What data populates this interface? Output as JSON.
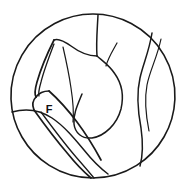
{
  "figure": {
    "kind": "endoscopic-line-drawing",
    "field_shape": "circle",
    "background_color": "#ffffff",
    "line_color": "#1a1a1a",
    "field": {
      "center_x": 93,
      "center_y": 96,
      "radius": 82
    },
    "labels": [
      {
        "id": "forceps",
        "text": "F",
        "x": 49,
        "y": 110
      }
    ],
    "instrument": {
      "name": "forceps",
      "entry": "lower-left",
      "label": "F"
    },
    "paths": {
      "field_circle": "M 93 14 A 82 82 0 1 1 92.9 14 Z",
      "top_vertical": "M 98 15 C 97 34 96 44 97 56",
      "central_mass_outer": "M 97 56 C 104 62 110 66 115 74 C 122 84 124 96 121 109 C 117 124 105 136 92 138 C 82 139 75 133 74 124 C 73 114 78 104 82 94",
      "central_mass_inner_left": "M 97 56 C 88 56 79 52 71 46 C 64 41 58 38 54 40",
      "right_curve_outer": "M 152 33 C 149 52 143 64 140 78 C 136 95 138 112 141 128 C 143 142 143 155 140 166",
      "right_curve_inner": "M 161 39 C 157 58 150 70 147 85 C 144 101 146 116 149 131",
      "mid_right_fold": "M 117 43 C 112 52 108 58 106 66",
      "lower_left_tissue": "M 12 112 C 26 108 40 110 52 118 C 64 126 74 138 84 150 C 92 160 100 168 108 174",
      "upper_jaw_outer": "M 54 40 C 47 54 41 68 37 82 C 35 89 34 94 36 97",
      "upper_jaw_inner": "M 54 44 C 49 57 44 70 41 82 C 39 89 38 93 39 96",
      "upper_jaw_tip": "M 36 97 C 39 93 44 91 49 91",
      "jaw_joint": "M 36 97 C 33 100 32 105 34 110",
      "lower_jaw_top": "M 49 91 C 58 99 68 110 77 122 C 86 134 94 147 101 160",
      "lower_jaw_bottom": "M 34 110 C 44 124 56 140 68 154 C 76 164 84 172 91 178",
      "shaft_ridge": "M 41 112 C 52 127 64 143 76 157 C 83 165 89 172 94 178",
      "blade_seam": "M 63 47 C 66 60 69 74 71 88 C 73 101 74 112 73 122"
    }
  }
}
